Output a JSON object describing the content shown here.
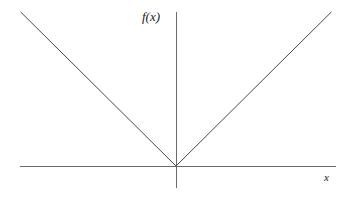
{
  "figure": {
    "background_color": "#ffffff",
    "line_color": "#4a4a4a",
    "text_color": "#1a1a1a",
    "width": 357,
    "height": 202
  },
  "labels": {
    "y_axis": "f(x)",
    "x_axis": "x"
  },
  "chart_data": {
    "type": "line",
    "title": "",
    "xlabel": "x",
    "ylabel": "f(x)",
    "grid": false,
    "legend": null,
    "xlim": [
      -1.0,
      1.03
    ],
    "ylim": [
      -0.14,
      1.0
    ],
    "origin_px": [
      176,
      166
    ],
    "series": [
      {
        "name": "f(x) = |x|",
        "x": [
          -1.0,
          0.0,
          1.0
        ],
        "y": [
          1.0,
          0.0,
          1.0
        ],
        "color": "#4a4a4a",
        "width": 1
      }
    ],
    "axes": [
      {
        "name": "x-axis",
        "orientation": "horizontal",
        "x_start_px": 20,
        "x_end_px": 336,
        "y_px": 166,
        "color": "#6b6b6b"
      },
      {
        "name": "y-axis",
        "orientation": "vertical",
        "y_start_px": 12,
        "y_end_px": 188,
        "x_px": 176,
        "color": "#6b6b6b"
      }
    ],
    "annotations": [
      {
        "text": "f(x)",
        "x_px": 142,
        "y_px": 10,
        "style": "italic-serif"
      },
      {
        "text": "x",
        "x_px": 324,
        "y_px": 172,
        "style": "italic-serif"
      }
    ]
  }
}
